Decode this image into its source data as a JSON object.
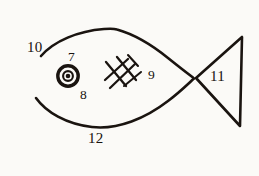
{
  "figure": {
    "background_color": "#fbfaf7",
    "ink_color": "#1a1410",
    "width": 259,
    "height": 176
  },
  "callouts": [
    {
      "id": "callout-7",
      "text": "7",
      "refers_to": "eye-pupil",
      "x": 68,
      "y": 50
    },
    {
      "id": "callout-8",
      "text": "8",
      "refers_to": "eye-outer-ring",
      "x": 80,
      "y": 88
    },
    {
      "id": "callout-9",
      "text": "9",
      "refers_to": "crosshatch-marks",
      "x": 148,
      "y": 68
    },
    {
      "id": "callout-10",
      "text": "10",
      "refers_to": "body-upper-curve",
      "x": 27,
      "y": 40
    },
    {
      "id": "callout-11",
      "text": "11",
      "refers_to": "tail-triangle",
      "x": 210,
      "y": 69
    },
    {
      "id": "callout-12",
      "text": "12",
      "refers_to": "body-lower-curve",
      "x": 88,
      "y": 131
    }
  ],
  "shapes": {
    "body_upper_curve": "body upper outline arc",
    "body_lower_curve": "body lower outline arc",
    "eye": "concentric circle with solid pupil",
    "crosshatch": "diagonal cross-hatched gill marks",
    "tail": "left-pointing triangle"
  }
}
